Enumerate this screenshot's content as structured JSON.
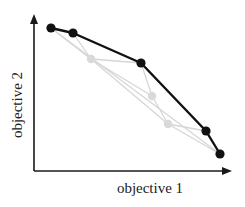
{
  "diagram": {
    "x_axis_label": "objective 1",
    "y_axis_label": "objective 2",
    "colors": {
      "axis": "#1a1a1a",
      "front_line": "#111111",
      "front_point": "#111111",
      "dominated_line": "#d6d6d6",
      "dominated_point": "#d9d9d9",
      "background": "#ffffff"
    },
    "axes": {
      "origin": [
        34,
        171
      ],
      "y_top": [
        34,
        14
      ],
      "x_right": [
        232,
        171
      ]
    },
    "pareto_front_points": [
      [
        51,
        28
      ],
      [
        73,
        33
      ],
      [
        141,
        63
      ],
      [
        206,
        131
      ],
      [
        220,
        154
      ]
    ],
    "dominated_points": [
      [
        91,
        59
      ],
      [
        152,
        96
      ],
      [
        168,
        124
      ]
    ],
    "grey_edges": [
      [
        [
          51,
          28
        ],
        [
          91,
          59
        ]
      ],
      [
        [
          73,
          33
        ],
        [
          91,
          59
        ]
      ],
      [
        [
          91,
          59
        ],
        [
          141,
          63
        ]
      ],
      [
        [
          141,
          63
        ],
        [
          152,
          96
        ]
      ],
      [
        [
          91,
          59
        ],
        [
          152,
          96
        ]
      ],
      [
        [
          152,
          96
        ],
        [
          168,
          124
        ]
      ],
      [
        [
          91,
          59
        ],
        [
          168,
          124
        ]
      ],
      [
        [
          168,
          124
        ],
        [
          206,
          131
        ]
      ],
      [
        [
          168,
          124
        ],
        [
          220,
          154
        ]
      ],
      [
        [
          51,
          28
        ],
        [
          220,
          154
        ]
      ]
    ]
  }
}
